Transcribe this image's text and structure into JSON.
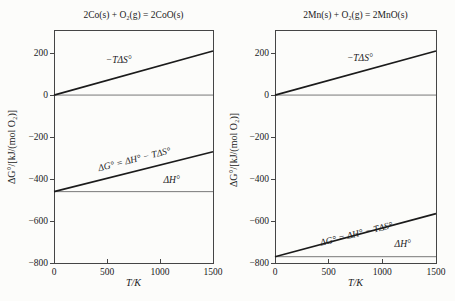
{
  "figure": {
    "background": "#fcfcfa",
    "thick_line_color": "#1b1b1b",
    "thin_line_color": "#787878",
    "frame_color": "#454545",
    "text_color": "#1a1a1a"
  },
  "chart_data": [
    {
      "type": "line",
      "title": "2Co(s) + O₂(g) = 2CoO(s)",
      "xlabel": "T/K",
      "ylabel": "ΔG°/[kJ/(mol O₂)]",
      "xlim": [
        0,
        1500
      ],
      "ylim": [
        -800,
        310
      ],
      "grid": false,
      "legend": "none",
      "xticks": [
        {
          "v": 0,
          "label": "0"
        },
        {
          "v": 500,
          "label": "500"
        },
        {
          "v": 1000,
          "label": "1000"
        },
        {
          "v": 1500,
          "label": "1500"
        }
      ],
      "yticks": [
        {
          "v": 200,
          "label": "200"
        },
        {
          "v": 0,
          "label": "0"
        },
        {
          "v": -200,
          "label": "−200"
        },
        {
          "v": -400,
          "label": "−400"
        },
        {
          "v": -600,
          "label": "−600"
        },
        {
          "v": -800,
          "label": "−800"
        }
      ],
      "series": [
        {
          "name": "zero-reference-line",
          "style": "thin",
          "x": [
            0,
            1500
          ],
          "y": [
            0,
            0
          ]
        },
        {
          "name": "−TΔS°",
          "style": "thick",
          "x": [
            0,
            1500
          ],
          "y": [
            0,
            210
          ]
        },
        {
          "name": "ΔH°",
          "style": "thin",
          "x": [
            0,
            1500
          ],
          "y": [
            -460,
            -460
          ]
        },
        {
          "name": "ΔG° = ΔH° − TΔS°",
          "style": "thick",
          "x": [
            0,
            1500
          ],
          "y": [
            -460,
            -270
          ]
        }
      ],
      "annotations": [
        {
          "text": "−TΔS°",
          "T": 610,
          "v": 155,
          "rotate": 0
        },
        {
          "text": "ΔG° = ΔH° − TΔS°",
          "T": 765,
          "v": -320,
          "rotate": -14
        },
        {
          "text": "ΔH°",
          "T": 1110,
          "v": -420,
          "rotate": 0
        }
      ]
    },
    {
      "type": "line",
      "title": "2Mn(s) + O₂(g) = 2MnO(s)",
      "xlabel": "T/K",
      "ylabel": "ΔG°/[kJ/(mol O₂)]",
      "xlim": [
        0,
        1500
      ],
      "ylim": [
        -800,
        310
      ],
      "grid": false,
      "legend": "none",
      "xticks": [
        {
          "v": 0,
          "label": "0"
        },
        {
          "v": 500,
          "label": "500"
        },
        {
          "v": 1000,
          "label": "1000"
        },
        {
          "v": 1500,
          "label": "1500"
        }
      ],
      "yticks": [
        {
          "v": 200,
          "label": "200"
        },
        {
          "v": 0,
          "label": "0"
        },
        {
          "v": -200,
          "label": "−200"
        },
        {
          "v": -400,
          "label": "−400"
        },
        {
          "v": -600,
          "label": "−600"
        },
        {
          "v": -800,
          "label": "−800"
        }
      ],
      "series": [
        {
          "name": "zero-reference-line",
          "style": "thin",
          "x": [
            0,
            1500
          ],
          "y": [
            0,
            0
          ]
        },
        {
          "name": "−TΔS°",
          "style": "thick",
          "x": [
            0,
            1500
          ],
          "y": [
            0,
            210
          ]
        },
        {
          "name": "ΔH°",
          "style": "thin",
          "x": [
            0,
            1500
          ],
          "y": [
            -770,
            -770
          ]
        },
        {
          "name": "ΔG° = ΔH° − TΔS°",
          "style": "thick",
          "x": [
            0,
            1500
          ],
          "y": [
            -770,
            -565
          ]
        }
      ],
      "annotations": [
        {
          "text": "−TΔS°",
          "T": 790,
          "v": 160,
          "rotate": 0
        },
        {
          "text": "ΔG° = ΔH° − TΔS°",
          "T": 765,
          "v": -675,
          "rotate": -14
        },
        {
          "text": "ΔH°",
          "T": 1190,
          "v": -725,
          "rotate": 0
        }
      ]
    }
  ]
}
